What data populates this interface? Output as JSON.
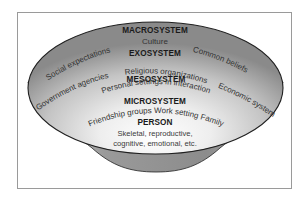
{
  "diagram": {
    "type": "nested-systems-bowl",
    "colors": {
      "frame": "#9a9a9a",
      "bowl_body": "#8f8f8f",
      "rim_outline": "#222222",
      "surface_light": "#f2f2f2",
      "surface_dark": "#8a8a8a",
      "text": "#1a1a1a"
    },
    "levels": {
      "macrosystem": {
        "title": "MACROSYSTEM",
        "items": {
          "center": "Culture",
          "left": "Social expectations",
          "right": "Common beliefs"
        }
      },
      "exosystem": {
        "title": "EXOSYSTEM",
        "items": {
          "left": "Government agencies",
          "center": "Religious organizations",
          "right": "Economic system"
        }
      },
      "mesosystem": {
        "title": "MESOSYSTEM",
        "items": {
          "center": "Personal settings in interaction"
        }
      },
      "microsystem": {
        "title": "MICROSYSTEM",
        "items": {
          "center": "Friendship groups Work setting Family"
        }
      },
      "person": {
        "title": "PERSON",
        "line1": "Skeletal, reproductive,",
        "line2": "cognitive, emotional, etc."
      }
    }
  }
}
